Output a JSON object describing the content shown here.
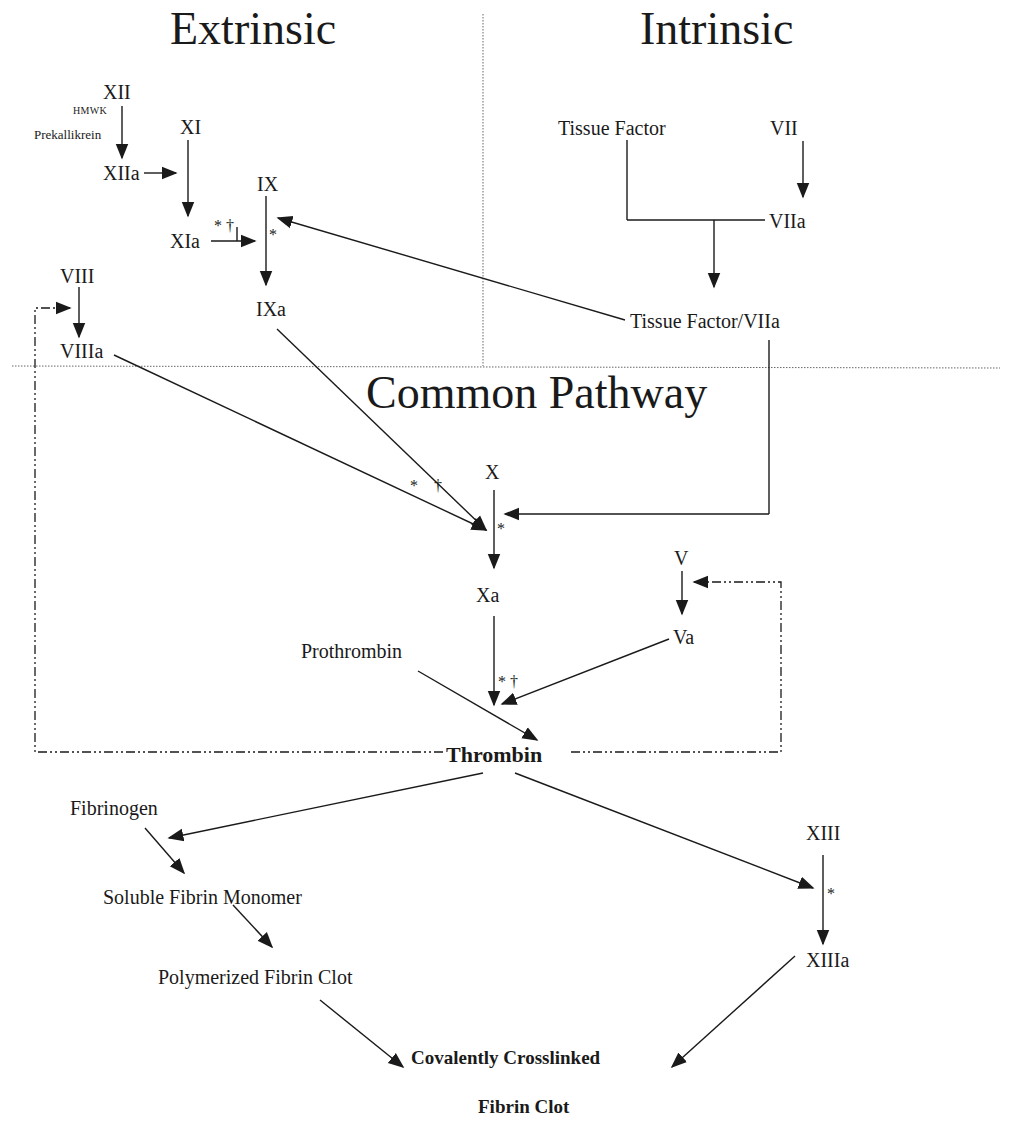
{
  "sections": {
    "extrinsic": "Extrinsic",
    "intrinsic": "Intrinsic",
    "common": "Common Pathway"
  },
  "nodes": {
    "xii": "XII",
    "hmwk": "HMWK",
    "prekallikrein": "Prekallikrein",
    "xiia": "XIIa",
    "xi": "XI",
    "xia": "XIa",
    "ix": "IX",
    "ixa": "IXa",
    "viii": "VIII",
    "viiia": "VIIIa",
    "tissue_factor": "Tissue Factor",
    "vii": "VII",
    "viia": "VIIa",
    "tf_viia": "Tissue Factor/VIIa",
    "x": "X",
    "xa": "Xa",
    "v": "V",
    "va": "Va",
    "prothrombin": "Prothrombin",
    "thrombin": "Thrombin",
    "fibrinogen": "Fibrinogen",
    "soluble_fibrin": "Soluble Fibrin Monomer",
    "polymerized_fibrin": "Polymerized Fibrin Clot",
    "xiii": "XIII",
    "xiiia": "XIIIa",
    "crosslinked_1": "Covalently Crosslinked",
    "crosslinked_2": "Fibrin Clot"
  },
  "markers": {
    "asterisk": "*",
    "dagger": "†",
    "asterisk_dagger": "* †"
  },
  "colors": {
    "line": "#1a1a1a",
    "divider": "#555555",
    "background": "#ffffff"
  }
}
